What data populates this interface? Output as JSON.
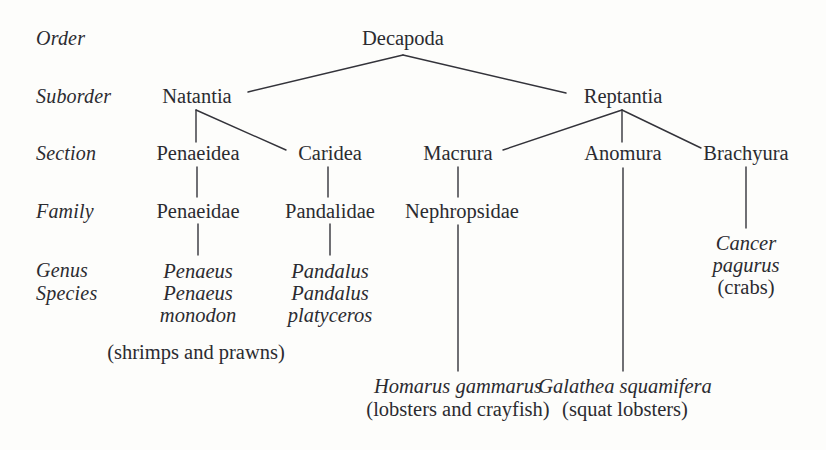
{
  "figure": {
    "type": "taxonomic-tree",
    "background_color": "#fdfdfb",
    "text_color": "#2b2b30",
    "line_color": "#33333a"
  },
  "rank_labels": [
    {
      "id": "order",
      "text": "Order",
      "x": 36,
      "y": 38
    },
    {
      "id": "suborder",
      "text": "Suborder",
      "x": 36,
      "y": 96
    },
    {
      "id": "section",
      "text": "Section",
      "x": 36,
      "y": 153
    },
    {
      "id": "family",
      "text": "Family",
      "x": 36,
      "y": 211
    },
    {
      "id": "genus",
      "text": "Genus",
      "x": 36,
      "y": 270
    },
    {
      "id": "species",
      "text": "Species",
      "x": 36,
      "y": 293
    }
  ],
  "nodes": {
    "decapoda": {
      "text": "Decapoda",
      "x": 403,
      "y": 38,
      "style": "taxon"
    },
    "natantia": {
      "text": "Natantia",
      "x": 197,
      "y": 96,
      "style": "taxon"
    },
    "reptantia": {
      "text": "Reptantia",
      "x": 623,
      "y": 96,
      "style": "taxon"
    },
    "penaeidea": {
      "text": "Penaeidea",
      "x": 198,
      "y": 153,
      "style": "taxon"
    },
    "caridea": {
      "text": "Caridea",
      "x": 330,
      "y": 153,
      "style": "taxon"
    },
    "macrura": {
      "text": "Macrura",
      "x": 458,
      "y": 153,
      "style": "taxon"
    },
    "anomura": {
      "text": "Anomura",
      "x": 623,
      "y": 153,
      "style": "taxon"
    },
    "brachyura": {
      "text": "Brachyura",
      "x": 746,
      "y": 153,
      "style": "taxon"
    },
    "penaeidae": {
      "text": "Penaeidae",
      "x": 198,
      "y": 211,
      "style": "taxon"
    },
    "pandalidae": {
      "text": "Pandalidae",
      "x": 330,
      "y": 211,
      "style": "taxon"
    },
    "nephropsidae": {
      "text": "Nephropsidae",
      "x": 462,
      "y": 211,
      "style": "taxon"
    }
  },
  "leaf_groups": {
    "penaeus": {
      "x": 198,
      "y": 270,
      "genus": "Penaeus",
      "species_line1": "Penaeus",
      "species_line2": "monodon"
    },
    "pandalus": {
      "x": 330,
      "y": 270,
      "genus": "Pandalus",
      "species_line1": "Pandalus",
      "species_line2": "platyceros"
    },
    "cancer": {
      "x": 746,
      "y": 242,
      "genus": "Cancer",
      "species_line2": "pagurus",
      "common": "(crabs)"
    }
  },
  "captions": [
    {
      "id": "shrimps-prawns",
      "text": "(shrimps and prawns)",
      "x": 196,
      "y": 352
    },
    {
      "id": "homarus-name",
      "text": "Homarus gammarus",
      "x": 458,
      "y": 386,
      "style": "sciname"
    },
    {
      "id": "homarus-common",
      "text": "(lobsters and crayfish)",
      "x": 458,
      "y": 409,
      "style": "common"
    },
    {
      "id": "galathea-name",
      "text": "Galathea squamifera",
      "x": 625,
      "y": 386,
      "style": "sciname"
    },
    {
      "id": "galathea-common",
      "text": "(squat lobsters)",
      "x": 625,
      "y": 409,
      "style": "common"
    }
  ],
  "connectors": [
    {
      "id": "decapoda-to-natantia",
      "x1": 403,
      "y1": 55,
      "x2": 248,
      "y2": 92
    },
    {
      "id": "decapoda-to-reptantia",
      "x1": 403,
      "y1": 55,
      "x2": 566,
      "y2": 93
    },
    {
      "id": "natantia-to-penaeidea",
      "x1": 196,
      "y1": 110,
      "x2": 196,
      "y2": 142
    },
    {
      "id": "natantia-to-caridea",
      "x1": 196,
      "y1": 110,
      "x2": 286,
      "y2": 150
    },
    {
      "id": "reptantia-to-macrura",
      "x1": 622,
      "y1": 110,
      "x2": 503,
      "y2": 150
    },
    {
      "id": "reptantia-to-anomura",
      "x1": 622,
      "y1": 110,
      "x2": 622,
      "y2": 142
    },
    {
      "id": "reptantia-to-brachyura",
      "x1": 622,
      "y1": 110,
      "x2": 701,
      "y2": 148
    },
    {
      "id": "penaeidea-to-penaeidae",
      "x1": 197,
      "y1": 167,
      "x2": 197,
      "y2": 197
    },
    {
      "id": "caridea-to-pandalidae",
      "x1": 328,
      "y1": 167,
      "x2": 328,
      "y2": 197
    },
    {
      "id": "macrura-to-nephropsidae",
      "x1": 458,
      "y1": 167,
      "x2": 458,
      "y2": 197
    },
    {
      "id": "penaeidae-to-penaeus",
      "x1": 198,
      "y1": 224,
      "x2": 198,
      "y2": 255
    },
    {
      "id": "pandalidae-to-pandalus",
      "x1": 330,
      "y1": 224,
      "x2": 330,
      "y2": 255
    },
    {
      "id": "brachyura-to-cancer",
      "x1": 746,
      "y1": 167,
      "x2": 746,
      "y2": 228
    },
    {
      "id": "nephropsidae-to-homarus",
      "x1": 458,
      "y1": 225,
      "x2": 458,
      "y2": 371
    },
    {
      "id": "anomura-to-galathea",
      "x1": 623,
      "y1": 168,
      "x2": 623,
      "y2": 371
    }
  ]
}
